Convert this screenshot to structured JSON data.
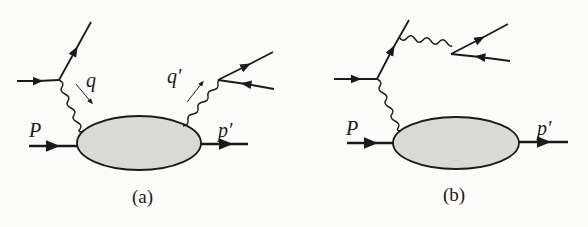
{
  "figure": {
    "panels": [
      {
        "caption": "(a)",
        "labels": {
          "incoming_hadron": "P",
          "outgoing_hadron": "p′",
          "photon_in": "q",
          "photon_out": "q′"
        },
        "description": "Lepton emits virtual photon q absorbed by blob; blob emits photon q′ producing lepton pair"
      },
      {
        "caption": "(b)",
        "labels": {
          "incoming_hadron": "P",
          "outgoing_hadron": "p′"
        },
        "description": "Lepton radiates photon producing lepton pair, and exchanges virtual photon with blob"
      }
    ],
    "colors": {
      "line": "#1a1a1a",
      "blob_fill": "#d9d9d6",
      "background": "#fbfbf9"
    }
  }
}
